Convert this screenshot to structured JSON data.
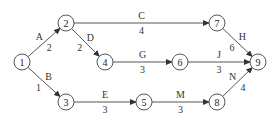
{
  "diagram": {
    "type": "activity-on-arrow network",
    "nodes": [
      {
        "id": "1",
        "x": 22,
        "y": 62
      },
      {
        "id": "2",
        "x": 66,
        "y": 23
      },
      {
        "id": "3",
        "x": 66,
        "y": 102
      },
      {
        "id": "4",
        "x": 105,
        "y": 62
      },
      {
        "id": "5",
        "x": 144,
        "y": 102
      },
      {
        "id": "6",
        "x": 180,
        "y": 62
      },
      {
        "id": "7",
        "x": 217,
        "y": 23
      },
      {
        "id": "8",
        "x": 217,
        "y": 102
      },
      {
        "id": "9",
        "x": 258,
        "y": 62
      }
    ],
    "edges": [
      {
        "from": "1",
        "to": "2",
        "activity": "A",
        "duration": "2"
      },
      {
        "from": "1",
        "to": "3",
        "activity": "B",
        "duration": "1"
      },
      {
        "from": "2",
        "to": "7",
        "activity": "C",
        "duration": "4"
      },
      {
        "from": "2",
        "to": "4",
        "activity": "D",
        "duration": "2"
      },
      {
        "from": "3",
        "to": "5",
        "activity": "E",
        "duration": "3"
      },
      {
        "from": "4",
        "to": "6",
        "activity": "G",
        "duration": "3"
      },
      {
        "from": "7",
        "to": "9",
        "activity": "H",
        "duration": "6"
      },
      {
        "from": "6",
        "to": "9",
        "activity": "J",
        "duration": "3"
      },
      {
        "from": "5",
        "to": "8",
        "activity": "M",
        "duration": "3"
      },
      {
        "from": "8",
        "to": "9",
        "activity": "N",
        "duration": "4"
      }
    ]
  }
}
